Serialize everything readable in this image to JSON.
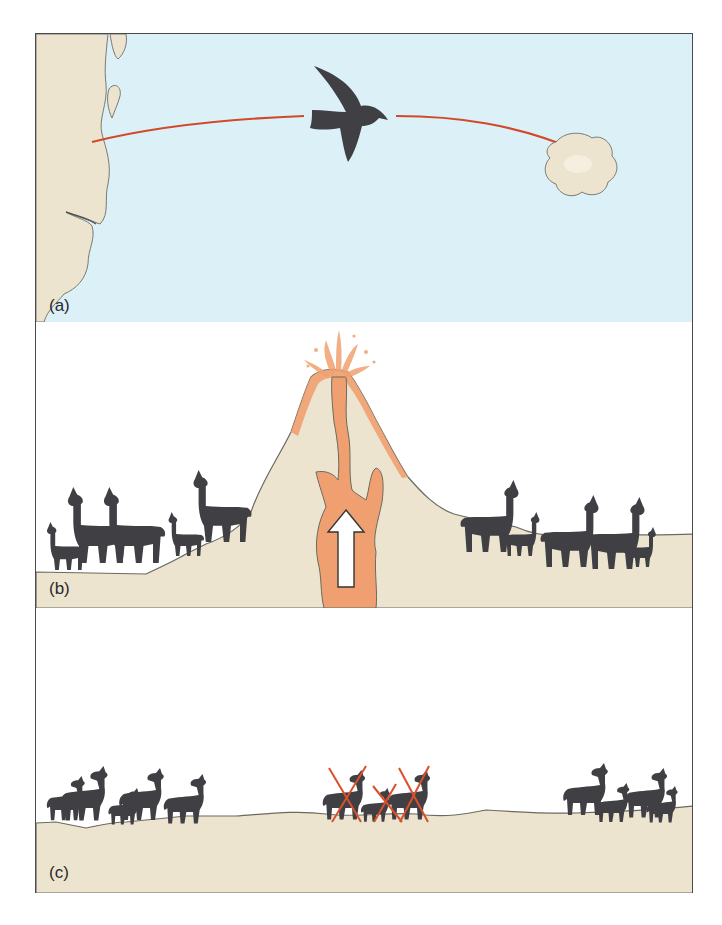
{
  "figure": {
    "panels": [
      {
        "id": "a",
        "label": "(a)",
        "scene": "bird carrying organism from mainland coast across water to a distant island",
        "elements": [
          "mainland-coast",
          "flight-path-arrow",
          "bird",
          "island"
        ]
      },
      {
        "id": "b",
        "label": "(b)",
        "scene": "volcanic eruption with rising magma splits a population of llama-like animals into two groups",
        "elements": [
          "volcano",
          "magma-chamber",
          "upward-arrow",
          "left-herd",
          "right-herd"
        ]
      },
      {
        "id": "c",
        "label": "(c)",
        "scene": "central subpopulation dies out (crossed out), leaving two isolated groups of deer-like animals",
        "elements": [
          "left-herd",
          "extinct-middle-group",
          "right-herd"
        ]
      }
    ]
  },
  "colors": {
    "water": "#dcf0f8",
    "land": "#ede4d0",
    "land_shadow": "#d6c9aa",
    "animal": "#3f3f44",
    "arrow": "#d2492a",
    "magma": "#f0a070",
    "magma_dark": "#e8874f",
    "border": "#4a4a4a",
    "cross": "#d9502c"
  }
}
